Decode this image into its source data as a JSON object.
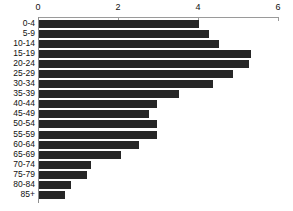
{
  "chart_data": {
    "type": "bar",
    "orientation": "horizontal",
    "title": "",
    "xlabel": "",
    "ylabel": "",
    "xlim": [
      0,
      6
    ],
    "xticks": [
      0,
      2,
      4,
      6
    ],
    "xtick_labels": [
      "0",
      "2",
      "4",
      "6"
    ],
    "grid": false,
    "legend": null,
    "bar_color": "#262626",
    "axis_color": "#9a9a9a",
    "background": "#ffffff",
    "categories": [
      "0-4",
      "5-9",
      "10-14",
      "15-19",
      "20-24",
      "25-29",
      "30-34",
      "35-39",
      "40-44",
      "45-49",
      "50-54",
      "55-59",
      "60-64",
      "65-69",
      "70-74",
      "75-79",
      "80-84",
      "85+"
    ],
    "values": [
      4.0,
      4.25,
      4.5,
      5.3,
      5.25,
      4.85,
      4.35,
      3.5,
      2.95,
      2.75,
      2.95,
      2.95,
      2.5,
      2.05,
      1.3,
      1.2,
      0.8,
      0.65
    ]
  }
}
